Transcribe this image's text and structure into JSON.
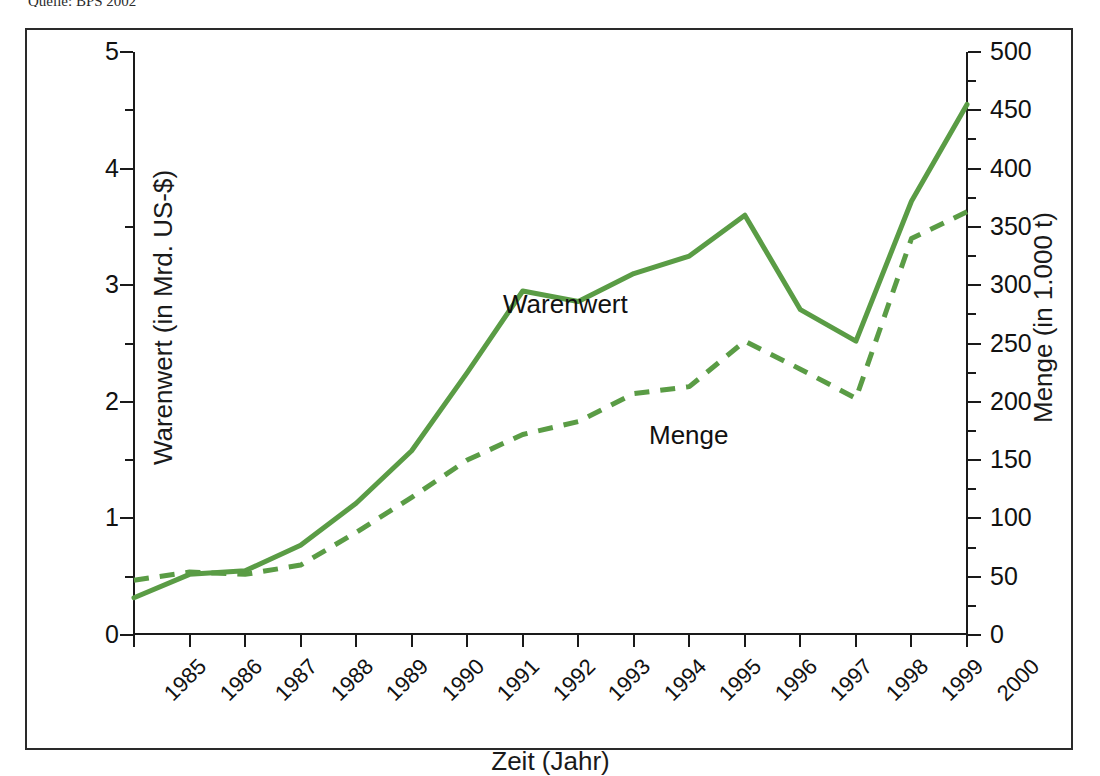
{
  "source_note": "Quelle: BPS 2002",
  "axes": {
    "left_title": "Warenwert (in Mrd. US-$)",
    "right_title": "Menge (in 1.000 t)",
    "bottom_title": "Zeit (Jahr)",
    "left_ticks": [
      "5",
      "4",
      "3",
      "2",
      "1",
      "0"
    ],
    "right_ticks": [
      "500",
      "450",
      "400",
      "350",
      "300",
      "250",
      "200",
      "150",
      "100",
      "50",
      "0"
    ]
  },
  "series_labels": {
    "warenwert": "Warenwert",
    "menge": "Menge"
  },
  "colors": {
    "line_green": "#5a9c45",
    "axis_black": "#1a1a1a",
    "frame_black": "#2a2a2a"
  },
  "chart_data": {
    "type": "line",
    "title": "",
    "xlabel": "Zeit (Jahr)",
    "ylabel": "Warenwert (in Mrd. US-$)",
    "y2label": "Menge (in 1.000 t)",
    "grid": false,
    "legend": "inline-annotations",
    "x": [
      "1985",
      "1986",
      "1987",
      "1988",
      "1989",
      "1990",
      "1991",
      "1992",
      "1993",
      "1994",
      "1995",
      "1996",
      "1997",
      "1998",
      "1999",
      "2000"
    ],
    "ylim": [
      0,
      5
    ],
    "y2lim": [
      0,
      500
    ],
    "ytick_step": 1,
    "ytick_minor_step": 0.5,
    "y2tick_step": 50,
    "y2tick_minor_step": 25,
    "series": [
      {
        "name": "Warenwert",
        "axis": "left",
        "unit": "Mrd. US-$",
        "style": "solid",
        "color": "#5a9c45",
        "values": [
          0.32,
          0.52,
          0.55,
          0.77,
          1.13,
          1.58,
          2.25,
          2.95,
          2.86,
          3.1,
          3.25,
          3.6,
          2.79,
          2.52,
          3.72,
          4.55
        ]
      },
      {
        "name": "Menge",
        "axis": "right",
        "unit": "1.000 t",
        "style": "dashed",
        "color": "#5a9c45",
        "values": [
          47,
          54,
          52,
          60,
          88,
          118,
          150,
          172,
          183,
          207,
          213,
          252,
          228,
          203,
          340,
          363
        ]
      }
    ]
  }
}
